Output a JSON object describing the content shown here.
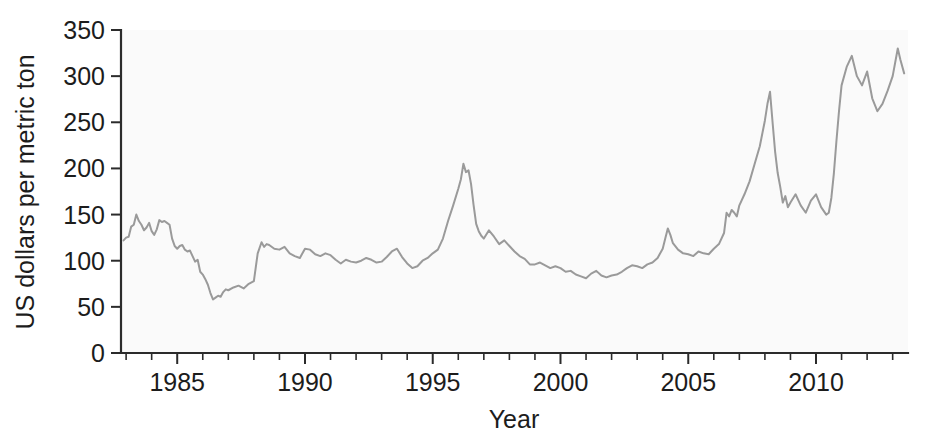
{
  "chart_data": {
    "type": "line",
    "title": "",
    "subtitle": "",
    "xlabel": "Year",
    "ylabel": "US dollars per metric ton",
    "xlim": [
      1982.8,
      2013.6
    ],
    "ylim": [
      0,
      350
    ],
    "xticks": [
      1985,
      1990,
      1995,
      2000,
      2005,
      2010
    ],
    "xticklabels": [
      "1985",
      "1990",
      "1995",
      "2000",
      "2005",
      "2010"
    ],
    "xtick_minor_step": 1,
    "yticks": [
      0,
      50,
      100,
      150,
      200,
      250,
      300,
      350
    ],
    "yticklabels": [
      "0",
      "50",
      "100",
      "150",
      "200",
      "250",
      "300",
      "350"
    ],
    "grid": false,
    "legend": false,
    "legend_position": "none",
    "line_color": "#9a9a9a",
    "background_color": "#fafafa",
    "axis_color": "#2b2b2b",
    "series": [
      {
        "name": "Price",
        "color": "#9a9a9a",
        "x": [
          1982.9,
          1983.0,
          1983.1,
          1983.2,
          1983.3,
          1983.4,
          1983.5,
          1983.6,
          1983.7,
          1983.8,
          1983.9,
          1984.0,
          1984.1,
          1984.2,
          1984.3,
          1984.4,
          1984.5,
          1984.6,
          1984.7,
          1984.8,
          1984.9,
          1985.0,
          1985.1,
          1985.2,
          1985.3,
          1985.4,
          1985.5,
          1985.6,
          1985.7,
          1985.8,
          1985.9,
          1986.0,
          1986.1,
          1986.2,
          1986.3,
          1986.4,
          1986.5,
          1986.6,
          1986.7,
          1986.8,
          1986.9,
          1987.0,
          1987.2,
          1987.4,
          1987.6,
          1987.8,
          1988.0,
          1988.15,
          1988.3,
          1988.4,
          1988.5,
          1988.6,
          1988.8,
          1989.0,
          1989.2,
          1989.4,
          1989.6,
          1989.8,
          1990.0,
          1990.2,
          1990.4,
          1990.6,
          1990.8,
          1991.0,
          1991.2,
          1991.4,
          1991.6,
          1991.8,
          1992.0,
          1992.2,
          1992.4,
          1992.6,
          1992.8,
          1993.0,
          1993.2,
          1993.4,
          1993.6,
          1993.8,
          1994.0,
          1994.2,
          1994.4,
          1994.6,
          1994.8,
          1995.0,
          1995.2,
          1995.4,
          1995.6,
          1995.8,
          1996.0,
          1996.1,
          1996.2,
          1996.3,
          1996.4,
          1996.5,
          1996.6,
          1996.7,
          1996.8,
          1996.9,
          1997.0,
          1997.2,
          1997.4,
          1997.6,
          1997.8,
          1998.0,
          1998.2,
          1998.4,
          1998.6,
          1998.8,
          1999.0,
          1999.2,
          1999.4,
          1999.6,
          1999.8,
          2000.0,
          2000.2,
          2000.4,
          2000.6,
          2000.8,
          2001.0,
          2001.2,
          2001.4,
          2001.6,
          2001.8,
          2002.0,
          2002.2,
          2002.4,
          2002.6,
          2002.8,
          2003.0,
          2003.2,
          2003.4,
          2003.6,
          2003.8,
          2004.0,
          2004.1,
          2004.2,
          2004.3,
          2004.4,
          2004.6,
          2004.8,
          2005.0,
          2005.2,
          2005.4,
          2005.6,
          2005.8,
          2006.0,
          2006.2,
          2006.4,
          2006.5,
          2006.6,
          2006.7,
          2006.8,
          2006.9,
          2007.0,
          2007.2,
          2007.4,
          2007.6,
          2007.8,
          2008.0,
          2008.1,
          2008.2,
          2008.3,
          2008.4,
          2008.5,
          2008.6,
          2008.7,
          2008.8,
          2008.9,
          2009.0,
          2009.2,
          2009.4,
          2009.6,
          2009.8,
          2010.0,
          2010.2,
          2010.4,
          2010.5,
          2010.6,
          2010.7,
          2010.8,
          2010.9,
          2011.0,
          2011.2,
          2011.4,
          2011.6,
          2011.8,
          2012.0,
          2012.2,
          2012.4,
          2012.6,
          2012.8,
          2013.0,
          2013.2,
          2013.3,
          2013.45
        ],
        "values": [
          122,
          125,
          126,
          137,
          139,
          150,
          143,
          139,
          133,
          136,
          141,
          132,
          128,
          134,
          144,
          142,
          143,
          141,
          139,
          124,
          116,
          113,
          116,
          117,
          112,
          110,
          111,
          105,
          99,
          101,
          88,
          85,
          80,
          74,
          65,
          58,
          60,
          62,
          61,
          66,
          69,
          68,
          71,
          73,
          70,
          75,
          78,
          108,
          120,
          115,
          118,
          117,
          113,
          112,
          115,
          108,
          105,
          103,
          113,
          112,
          107,
          105,
          108,
          106,
          101,
          97,
          101,
          99,
          98,
          100,
          103,
          101,
          98,
          99,
          104,
          110,
          113,
          104,
          97,
          92,
          94,
          100,
          103,
          108,
          112,
          124,
          143,
          160,
          178,
          188,
          205,
          196,
          198,
          183,
          160,
          140,
          132,
          127,
          124,
          133,
          126,
          118,
          122,
          116,
          110,
          105,
          102,
          96,
          96,
          98,
          95,
          92,
          94,
          92,
          88,
          89,
          85,
          83,
          81,
          86,
          89,
          84,
          82,
          84,
          85,
          88,
          92,
          95,
          94,
          92,
          96,
          98,
          103,
          113,
          124,
          135,
          128,
          119,
          112,
          108,
          107,
          105,
          110,
          108,
          107,
          113,
          118,
          130,
          152,
          148,
          155,
          152,
          148,
          160,
          172,
          186,
          205,
          224,
          252,
          270,
          283,
          250,
          218,
          195,
          180,
          163,
          170,
          158,
          163,
          172,
          160,
          152,
          165,
          172,
          158,
          150,
          152,
          168,
          195,
          230,
          262,
          290,
          310,
          322,
          300,
          290,
          305,
          276,
          262,
          270,
          284,
          300,
          330,
          318,
          303
        ]
      }
    ]
  },
  "axis": {
    "y_title": "US dollars per metric ton",
    "x_title": "Year"
  }
}
